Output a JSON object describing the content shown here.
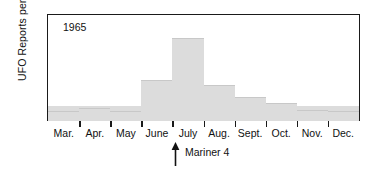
{
  "chart_data": {
    "type": "bar",
    "title": "",
    "xlabel": "",
    "ylabel": "UFO Reports per Month",
    "categories": [
      "Mar.",
      "Apr.",
      "May",
      "June",
      "July",
      "Aug.",
      "Sept.",
      "Oct.",
      "Nov.",
      "Dec."
    ],
    "values": [
      47,
      32,
      42,
      32,
      131,
      265,
      115,
      77,
      58,
      35
    ],
    "ylim": [
      0,
      340
    ],
    "yticks": [
      0,
      100,
      200,
      300
    ],
    "ytick_labels": [
      "0",
      "100",
      "200",
      "300"
    ],
    "grid": false,
    "legend": null,
    "bar_color": "#dcdcdc",
    "axis_color": "#1a1a1a",
    "annotations": [
      {
        "name": "year-label",
        "text": "1965",
        "position": "inside-plot-top-left"
      },
      {
        "name": "mariner-4-marker",
        "text": "Mariner 4",
        "arrow": "up",
        "at_category_boundary": "June/July"
      }
    ]
  }
}
